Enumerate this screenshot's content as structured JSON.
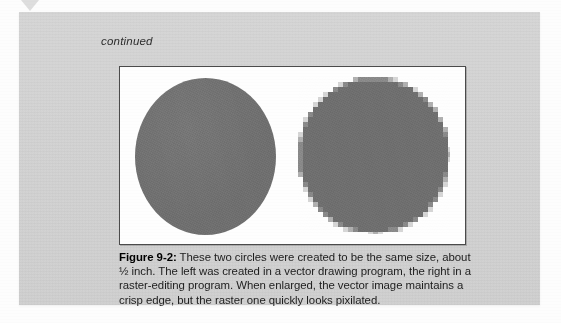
{
  "page": {
    "background_color": "#fdfdfd",
    "scan_marker_icon": "triangle-down-marker"
  },
  "sidebar": {
    "background_color": "#d3d3d3",
    "continued_label": "continued"
  },
  "figure": {
    "box_background": "#fefefe",
    "box_border_color": "#4b4b4b",
    "circle_fill_color": "#6f6f6f",
    "left_circle": {
      "name": "vector-circle",
      "render_type": "vector",
      "edge_quality": "crisp",
      "diameter_label": "about 1/2 inch"
    },
    "right_circle": {
      "name": "raster-circle",
      "render_type": "raster",
      "edge_quality": "pixilated",
      "diameter_label": "about 1/2 inch",
      "pixel_block_size": 5
    }
  },
  "caption": {
    "label": "Figure 9-2:",
    "text": " These two circles were created to be the same size, about ½ inch. The left was created in a vector drawing program, the right in a raster-editing program. When enlarged, the vector image maintains a crisp edge, but the raster one quickly looks pixilated."
  }
}
